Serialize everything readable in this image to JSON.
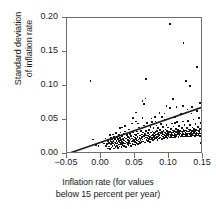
{
  "chart_data": {
    "type": "scatter",
    "title": "",
    "xlabel": "Inflation rate (for values below 15 percent per year)",
    "xlabel_lines": [
      "Inflation rate (for values",
      "below 15 percent per year)"
    ],
    "ylabel": "Standard deviation of inflation rate",
    "ylabel_lines": [
      "Standard deviation",
      "of inflation rate"
    ],
    "xlim": [
      -0.05,
      0.15
    ],
    "ylim": [
      0.0,
      0.2
    ],
    "xticks": [
      "-0.05",
      "0.00",
      "0.05",
      "0.10",
      "0.15"
    ],
    "xtick_values": [
      -0.05,
      0.0,
      0.05,
      0.1,
      0.15
    ],
    "yticks": [
      "0.00",
      "0.05",
      "0.10",
      "0.15",
      "0.20"
    ],
    "ytick_values": [
      0.0,
      0.05,
      0.1,
      0.15,
      0.2
    ],
    "grid": false,
    "legend": "none",
    "marker_color": "#151515",
    "axis_color": "#6e6e6e",
    "fit_line": {
      "label": "regression line",
      "color": "#1a1a1a",
      "x0": -0.05,
      "y0": 0.0,
      "x1": 0.155,
      "y1": 0.071,
      "slope": 0.3463,
      "intercept": 0.01732
    },
    "points": [
      [
        -0.0165,
        0.1085
      ],
      [
        -0.0135,
        0.0225
      ],
      [
        -0.0085,
        0.0145
      ],
      [
        -0.005,
        0.013
      ],
      [
        0.001,
        0.019
      ],
      [
        0.0035,
        0.0165
      ],
      [
        0.0055,
        0.024
      ],
      [
        0.0065,
        0.0135
      ],
      [
        0.008,
        0.0155
      ],
      [
        0.009,
        0.0095
      ],
      [
        0.0095,
        0.0205
      ],
      [
        0.0105,
        0.0175
      ],
      [
        0.011,
        0.0125
      ],
      [
        0.0115,
        0.0295
      ],
      [
        0.012,
        0.0085
      ],
      [
        0.0125,
        0.02
      ],
      [
        0.013,
        0.0155
      ],
      [
        0.0135,
        0.025
      ],
      [
        0.014,
        0.011
      ],
      [
        0.0145,
        0.0185
      ],
      [
        0.015,
        0.0225
      ],
      [
        0.0155,
        0.013
      ],
      [
        0.016,
        0.03
      ],
      [
        0.0165,
        0.0165
      ],
      [
        0.017,
        0.0205
      ],
      [
        0.0175,
        0.0095
      ],
      [
        0.018,
        0.0265
      ],
      [
        0.0185,
        0.0145
      ],
      [
        0.019,
        0.018
      ],
      [
        0.0195,
        0.0235
      ],
      [
        0.02,
        0.012
      ],
      [
        0.0205,
        0.032
      ],
      [
        0.021,
        0.0165
      ],
      [
        0.0215,
        0.0205
      ],
      [
        0.022,
        0.0135
      ],
      [
        0.0225,
        0.026
      ],
      [
        0.023,
        0.0175
      ],
      [
        0.0235,
        0.0105
      ],
      [
        0.024,
        0.023
      ],
      [
        0.0245,
        0.0195
      ],
      [
        0.025,
        0.029
      ],
      [
        0.025,
        0.015
      ],
      [
        0.0255,
        0.0205
      ],
      [
        0.026,
        0.0125
      ],
      [
        0.0265,
        0.025
      ],
      [
        0.027,
        0.018
      ],
      [
        0.0275,
        0.033
      ],
      [
        0.028,
        0.016
      ],
      [
        0.0285,
        0.0215
      ],
      [
        0.029,
        0.0115
      ],
      [
        0.0295,
        0.0275
      ],
      [
        0.03,
        0.019
      ],
      [
        0.03,
        0.04
      ],
      [
        0.0305,
        0.0145
      ],
      [
        0.031,
        0.0235
      ],
      [
        0.0315,
        0.0175
      ],
      [
        0.032,
        0.0305
      ],
      [
        0.0325,
        0.013
      ],
      [
        0.033,
        0.021
      ],
      [
        0.0335,
        0.0255
      ],
      [
        0.034,
        0.0165
      ],
      [
        0.0345,
        0.0345
      ],
      [
        0.035,
        0.0195
      ],
      [
        0.0355,
        0.012
      ],
      [
        0.036,
        0.024
      ],
      [
        0.0365,
        0.018
      ],
      [
        0.037,
        0.029
      ],
      [
        0.0375,
        0.0155
      ],
      [
        0.038,
        0.022
      ],
      [
        0.0385,
        0.0265
      ],
      [
        0.039,
        0.014
      ],
      [
        0.0395,
        0.02
      ],
      [
        0.04,
        0.0375
      ],
      [
        0.04,
        0.0175
      ],
      [
        0.0405,
        0.025
      ],
      [
        0.041,
        0.031
      ],
      [
        0.0415,
        0.0165
      ],
      [
        0.042,
        0.0225
      ],
      [
        0.0425,
        0.013
      ],
      [
        0.043,
        0.028
      ],
      [
        0.0435,
        0.0195
      ],
      [
        0.044,
        0.046
      ],
      [
        0.0445,
        0.024
      ],
      [
        0.045,
        0.016
      ],
      [
        0.0455,
        0.033
      ],
      [
        0.046,
        0.0205
      ],
      [
        0.0465,
        0.027
      ],
      [
        0.047,
        0.015
      ],
      [
        0.0475,
        0.0215
      ],
      [
        0.048,
        0.03
      ],
      [
        0.0485,
        0.0185
      ],
      [
        0.049,
        0.0255
      ],
      [
        0.0495,
        0.014
      ],
      [
        0.05,
        0.0625
      ],
      [
        0.05,
        0.023
      ],
      [
        0.0505,
        0.029
      ],
      [
        0.051,
        0.0175
      ],
      [
        0.0515,
        0.0345
      ],
      [
        0.052,
        0.021
      ],
      [
        0.0525,
        0.0265
      ],
      [
        0.053,
        0.016
      ],
      [
        0.0535,
        0.0315
      ],
      [
        0.054,
        0.0225
      ],
      [
        0.0545,
        0.0195
      ],
      [
        0.055,
        0.04
      ],
      [
        0.0555,
        0.025
      ],
      [
        0.056,
        0.017
      ],
      [
        0.0565,
        0.0285
      ],
      [
        0.057,
        0.0215
      ],
      [
        0.0575,
        0.0355
      ],
      [
        0.058,
        0.024
      ],
      [
        0.0585,
        0.0185
      ],
      [
        0.059,
        0.03
      ],
      [
        0.0595,
        0.026
      ],
      [
        0.06,
        0.079
      ],
      [
        0.06,
        0.0225
      ],
      [
        0.0605,
        0.033
      ],
      [
        0.061,
        0.0195
      ],
      [
        0.0615,
        0.0275
      ],
      [
        0.062,
        0.043
      ],
      [
        0.0625,
        0.024
      ],
      [
        0.063,
        0.031
      ],
      [
        0.0635,
        0.018
      ],
      [
        0.064,
        0.029
      ],
      [
        0.0645,
        0.0255
      ],
      [
        0.065,
        0.1115
      ],
      [
        0.065,
        0.035
      ],
      [
        0.0655,
        0.0215
      ],
      [
        0.066,
        0.0285
      ],
      [
        0.0665,
        0.0465
      ],
      [
        0.067,
        0.0245
      ],
      [
        0.0675,
        0.032
      ],
      [
        0.068,
        0.02
      ],
      [
        0.0685,
        0.0275
      ],
      [
        0.069,
        0.037
      ],
      [
        0.0695,
        0.0235
      ],
      [
        0.07,
        0.03
      ],
      [
        0.0705,
        0.019
      ],
      [
        0.071,
        0.0265
      ],
      [
        0.0715,
        0.041
      ],
      [
        0.072,
        0.033
      ],
      [
        0.0725,
        0.0225
      ],
      [
        0.073,
        0.0285
      ],
      [
        0.0735,
        0.048
      ],
      [
        0.074,
        0.025
      ],
      [
        0.0745,
        0.0345
      ],
      [
        0.075,
        0.0215
      ],
      [
        0.0755,
        0.0295
      ],
      [
        0.076,
        0.039
      ],
      [
        0.0765,
        0.026
      ],
      [
        0.077,
        0.032
      ],
      [
        0.0775,
        0.023
      ],
      [
        0.078,
        0.0285
      ],
      [
        0.0785,
        0.056
      ],
      [
        0.079,
        0.034
      ],
      [
        0.0795,
        0.0245
      ],
      [
        0.08,
        0.03
      ],
      [
        0.0805,
        0.043
      ],
      [
        0.081,
        0.0265
      ],
      [
        0.0815,
        0.0355
      ],
      [
        0.082,
        0.022
      ],
      [
        0.0825,
        0.031
      ],
      [
        0.083,
        0.0395
      ],
      [
        0.0835,
        0.0275
      ],
      [
        0.084,
        0.033
      ],
      [
        0.0845,
        0.024
      ],
      [
        0.085,
        0.062
      ],
      [
        0.085,
        0.0295
      ],
      [
        0.0855,
        0.0365
      ],
      [
        0.086,
        0.0255
      ],
      [
        0.0865,
        0.032
      ],
      [
        0.087,
        0.045
      ],
      [
        0.0875,
        0.0285
      ],
      [
        0.088,
        0.034
      ],
      [
        0.0885,
        0.0235
      ],
      [
        0.089,
        0.0305
      ],
      [
        0.0895,
        0.041
      ],
      [
        0.09,
        0.027
      ],
      [
        0.0905,
        0.035
      ],
      [
        0.091,
        0.03
      ],
      [
        0.0915,
        0.0245
      ],
      [
        0.092,
        0.052
      ],
      [
        0.0925,
        0.033
      ],
      [
        0.093,
        0.0285
      ],
      [
        0.0935,
        0.0375
      ],
      [
        0.094,
        0.026
      ],
      [
        0.0945,
        0.0315
      ],
      [
        0.095,
        0.044
      ],
      [
        0.0955,
        0.029
      ],
      [
        0.096,
        0.0355
      ],
      [
        0.0965,
        0.025
      ],
      [
        0.097,
        0.032
      ],
      [
        0.0975,
        0.04
      ],
      [
        0.098,
        0.0275
      ],
      [
        0.0985,
        0.0345
      ],
      [
        0.099,
        0.03
      ],
      [
        0.0995,
        0.0255
      ],
      [
        0.1,
        0.1925
      ],
      [
        0.1,
        0.069
      ],
      [
        0.1005,
        0.0335
      ],
      [
        0.101,
        0.029
      ],
      [
        0.1015,
        0.038
      ],
      [
        0.102,
        0.0265
      ],
      [
        0.1025,
        0.0325
      ],
      [
        0.103,
        0.046
      ],
      [
        0.1035,
        0.0295
      ],
      [
        0.104,
        0.036
      ],
      [
        0.1045,
        0.0255
      ],
      [
        0.105,
        0.033
      ],
      [
        0.1055,
        0.0415
      ],
      [
        0.106,
        0.0285
      ],
      [
        0.1065,
        0.035
      ],
      [
        0.107,
        0.0305
      ],
      [
        0.1075,
        0.026
      ],
      [
        0.108,
        0.055
      ],
      [
        0.1085,
        0.034
      ],
      [
        0.109,
        0.0295
      ],
      [
        0.1095,
        0.0385
      ],
      [
        0.11,
        0.027
      ],
      [
        0.1105,
        0.0335
      ],
      [
        0.111,
        0.048
      ],
      [
        0.1115,
        0.0305
      ],
      [
        0.112,
        0.0365
      ],
      [
        0.1125,
        0.0265
      ],
      [
        0.113,
        0.034
      ],
      [
        0.1135,
        0.0425
      ],
      [
        0.114,
        0.0295
      ],
      [
        0.1145,
        0.0355
      ],
      [
        0.115,
        0.0315
      ],
      [
        0.1155,
        0.027
      ],
      [
        0.116,
        0.06
      ],
      [
        0.1165,
        0.0345
      ],
      [
        0.117,
        0.03
      ],
      [
        0.1175,
        0.039
      ],
      [
        0.118,
        0.0275
      ],
      [
        0.1185,
        0.034
      ],
      [
        0.119,
        0.049
      ],
      [
        0.1195,
        0.031
      ],
      [
        0.12,
        0.1645
      ],
      [
        0.12,
        0.037
      ],
      [
        0.1205,
        0.027
      ],
      [
        0.121,
        0.0345
      ],
      [
        0.1215,
        0.0435
      ],
      [
        0.122,
        0.03
      ],
      [
        0.1225,
        0.036
      ],
      [
        0.123,
        0.032
      ],
      [
        0.1235,
        0.0275
      ],
      [
        0.124,
        0.1085
      ],
      [
        0.1245,
        0.035
      ],
      [
        0.125,
        0.0305
      ],
      [
        0.1255,
        0.0395
      ],
      [
        0.126,
        0.028
      ],
      [
        0.1265,
        0.0345
      ],
      [
        0.127,
        0.05
      ],
      [
        0.1275,
        0.0315
      ],
      [
        0.128,
        0.0375
      ],
      [
        0.1285,
        0.027
      ],
      [
        0.129,
        0.035
      ],
      [
        0.1295,
        0.044
      ],
      [
        0.13,
        0.1015
      ],
      [
        0.13,
        0.0305
      ],
      [
        0.1305,
        0.0365
      ],
      [
        0.131,
        0.0325
      ],
      [
        0.1315,
        0.028
      ],
      [
        0.132,
        0.061
      ],
      [
        0.1325,
        0.0355
      ],
      [
        0.133,
        0.031
      ],
      [
        0.1335,
        0.04
      ],
      [
        0.134,
        0.0285
      ],
      [
        0.1345,
        0.035
      ],
      [
        0.135,
        0.052
      ],
      [
        0.1355,
        0.032
      ],
      [
        0.136,
        0.038
      ],
      [
        0.1365,
        0.0275
      ],
      [
        0.137,
        0.0355
      ],
      [
        0.1375,
        0.0455
      ],
      [
        0.138,
        0.031
      ],
      [
        0.1385,
        0.037
      ],
      [
        0.139,
        0.033
      ],
      [
        0.1395,
        0.0285
      ],
      [
        0.14,
        0.1295
      ],
      [
        0.14,
        0.064
      ],
      [
        0.1405,
        0.036
      ],
      [
        0.141,
        0.0315
      ],
      [
        0.1415,
        0.041
      ],
      [
        0.142,
        0.029
      ],
      [
        0.1425,
        0.0355
      ],
      [
        0.143,
        0.054
      ],
      [
        0.1435,
        0.0325
      ],
      [
        0.144,
        0.0385
      ],
      [
        0.1445,
        0.028
      ],
      [
        0.145,
        0.0175
      ],
      [
        0.1455,
        0.0465
      ],
      [
        0.146,
        0.0315
      ],
      [
        0.1465,
        0.0375
      ],
      [
        0.147,
        0.0335
      ],
      [
        0.1475,
        0.029
      ],
      [
        0.148,
        0.1235
      ],
      [
        0.148,
        0.0655
      ],
      [
        0.1485,
        0.0365
      ],
      [
        0.149,
        0.032
      ],
      [
        0.1495,
        0.042
      ],
      [
        0.15,
        0.1105
      ],
      [
        0.15,
        0.058
      ],
      [
        0.1505,
        0.036
      ],
      [
        0.151,
        0.03
      ],
      [
        0.1515,
        0.049
      ],
      [
        0.152,
        0.033
      ],
      [
        0.1525,
        0.064
      ],
      [
        0.153,
        0.0395
      ],
      [
        0.1535,
        0.031
      ],
      [
        0.154,
        0.035
      ],
      [
        0.11,
        0.07
      ],
      [
        0.105,
        0.082
      ],
      [
        0.095,
        0.072
      ],
      [
        0.064,
        0.083
      ],
      [
        0.062,
        0.0745
      ],
      [
        0.046,
        0.0545
      ],
      [
        0.05,
        0.049
      ],
      [
        0.034,
        0.042
      ],
      [
        0.027,
        0.039
      ],
      [
        0.088,
        0.0555
      ],
      [
        0.092,
        0.061
      ],
      [
        0.119,
        0.072
      ],
      [
        0.126,
        0.0665
      ],
      [
        0.133,
        0.07
      ],
      [
        0.144,
        0.076
      ],
      [
        0.108,
        0.047
      ],
      [
        0.073,
        0.0535
      ],
      [
        0.079,
        0.049
      ],
      [
        0.06,
        0.0545
      ],
      [
        0.053,
        0.046
      ]
    ]
  }
}
